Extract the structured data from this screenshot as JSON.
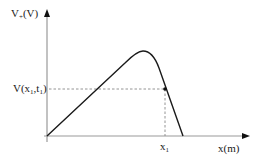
{
  "diagram": {
    "type": "function-plot",
    "y_axis": {
      "label_main": "V",
      "label_sub": "+",
      "label_unit": "(V)"
    },
    "x_axis": {
      "label": "x(m)"
    },
    "marked_point": {
      "value_label_main": "V(x",
      "value_label_sub1": "1",
      "value_label_mid": ",t",
      "value_label_sub2": "1",
      "value_label_end": ")",
      "x_label_main": "x",
      "x_label_sub": "1"
    },
    "curve": {
      "description": "Voltage rises linearly from origin, peaks, then falls steeply to zero",
      "stroke_color": "#1a1a1a"
    },
    "guide_color": "#888888",
    "axis_color": "#999999"
  }
}
